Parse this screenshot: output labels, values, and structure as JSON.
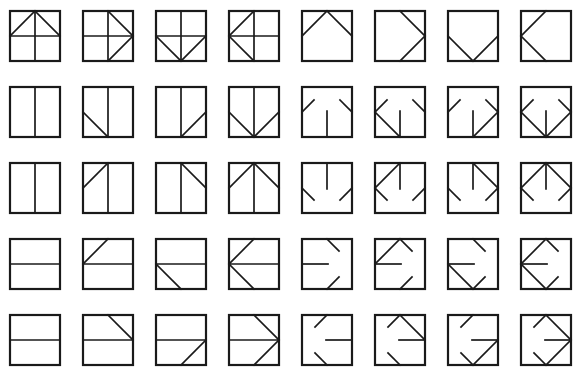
{
  "figure": {
    "rows": 5,
    "cols": 8,
    "stroke_color": "#1a1a1a",
    "background": "#ffffff",
    "layout": {
      "origin_x": 9,
      "origin_y": 10,
      "col_pitch": 73,
      "row_pitch": 76,
      "box_size": 50
    },
    "segment_library": {
      "V": [
        50,
        0,
        50,
        100
      ],
      "H": [
        0,
        50,
        100,
        50
      ],
      "TL": [
        50,
        0,
        0,
        50
      ],
      "TR": [
        50,
        0,
        100,
        50
      ],
      "BR": [
        100,
        50,
        50,
        100
      ],
      "BL": [
        0,
        50,
        50,
        100
      ],
      "Vb": [
        50,
        100,
        50,
        48
      ],
      "Vt": [
        50,
        0,
        50,
        52
      ],
      "Hl": [
        0,
        50,
        52,
        50
      ],
      "Hr": [
        48,
        50,
        100,
        50
      ],
      "sTLl": [
        0,
        50,
        24,
        26
      ],
      "sTRr": [
        76,
        26,
        100,
        50
      ],
      "sBLl": [
        0,
        50,
        24,
        74
      ],
      "sBRr": [
        76,
        74,
        100,
        50
      ],
      "sTRt": [
        50,
        0,
        74,
        24
      ],
      "sBRb": [
        50,
        100,
        74,
        76
      ],
      "sTLt": [
        50,
        0,
        26,
        24
      ],
      "sBLb": [
        50,
        100,
        26,
        76
      ]
    },
    "glyphs": [
      [
        [
          "V",
          "H",
          "TL",
          "TR"
        ],
        [
          "V",
          "H",
          "TR",
          "BR"
        ],
        [
          "V",
          "H",
          "BL",
          "BR"
        ],
        [
          "V",
          "H",
          "TL",
          "BL"
        ],
        [
          "TL",
          "TR"
        ],
        [
          "TR",
          "BR"
        ],
        [
          "BL",
          "BR"
        ],
        [
          "TL",
          "BL"
        ]
      ],
      [
        [
          "V"
        ],
        [
          "V",
          "BL"
        ],
        [
          "V",
          "BR"
        ],
        [
          "V",
          "BL",
          "BR"
        ],
        [
          "Vb",
          "sTLl",
          "sTRr"
        ],
        [
          "Vb",
          "sTLl",
          "sTRr",
          "BL"
        ],
        [
          "Vb",
          "sTLl",
          "sTRr",
          "BR"
        ],
        [
          "Vb",
          "sTLl",
          "sTRr",
          "BL",
          "BR"
        ]
      ],
      [
        [
          "V"
        ],
        [
          "V",
          "TL"
        ],
        [
          "V",
          "TR"
        ],
        [
          "V",
          "TL",
          "TR"
        ],
        [
          "Vt",
          "sBLl",
          "sBRr"
        ],
        [
          "Vt",
          "sBLl",
          "sBRr",
          "TL"
        ],
        [
          "Vt",
          "sBLl",
          "sBRr",
          "TR"
        ],
        [
          "Vt",
          "sBLl",
          "sBRr",
          "TL",
          "TR"
        ]
      ],
      [
        [
          "H"
        ],
        [
          "H",
          "TL"
        ],
        [
          "H",
          "BL"
        ],
        [
          "H",
          "TL",
          "BL"
        ],
        [
          "Hl",
          "sTRt",
          "sBRb"
        ],
        [
          "Hl",
          "sTRt",
          "sBRb",
          "TL"
        ],
        [
          "Hl",
          "sTRt",
          "sBRb",
          "BL"
        ],
        [
          "Hl",
          "sTRt",
          "sBRb",
          "TL",
          "BL"
        ]
      ],
      [
        [
          "H"
        ],
        [
          "H",
          "TR"
        ],
        [
          "H",
          "BR"
        ],
        [
          "H",
          "TR",
          "BR"
        ],
        [
          "Hr",
          "sTLt",
          "sBLb"
        ],
        [
          "Hr",
          "sTLt",
          "sBLb",
          "TR"
        ],
        [
          "Hr",
          "sTLt",
          "sBLb",
          "BR"
        ],
        [
          "Hr",
          "sTLt",
          "sBLb",
          "TR",
          "BR"
        ]
      ]
    ]
  }
}
